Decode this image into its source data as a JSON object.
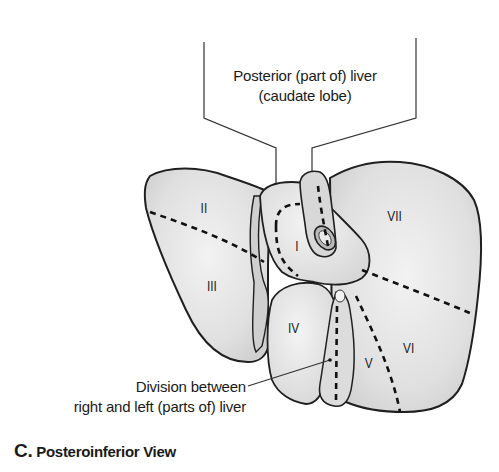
{
  "figure": {
    "panel_letter": "C.",
    "caption_title": "Posteroinferior View",
    "callouts": {
      "top_line1": "Posterior (part of) liver",
      "top_line2": "(caudate lobe)",
      "bottom_line1": "Division between",
      "bottom_line2": "right and left (parts of) liver"
    },
    "segments": [
      {
        "id": "II",
        "label": "II"
      },
      {
        "id": "III",
        "label": "III"
      },
      {
        "id": "I",
        "label": "I"
      },
      {
        "id": "IV",
        "label": "IV"
      },
      {
        "id": "V",
        "label": "V"
      },
      {
        "id": "VI",
        "label": "VI"
      },
      {
        "id": "VII",
        "label": "VII"
      }
    ],
    "colors": {
      "outline": "#1f1f1f",
      "fill": "#e6e6e6",
      "fill_dark": "#cfcfcf",
      "dashed": "#111111"
    }
  }
}
